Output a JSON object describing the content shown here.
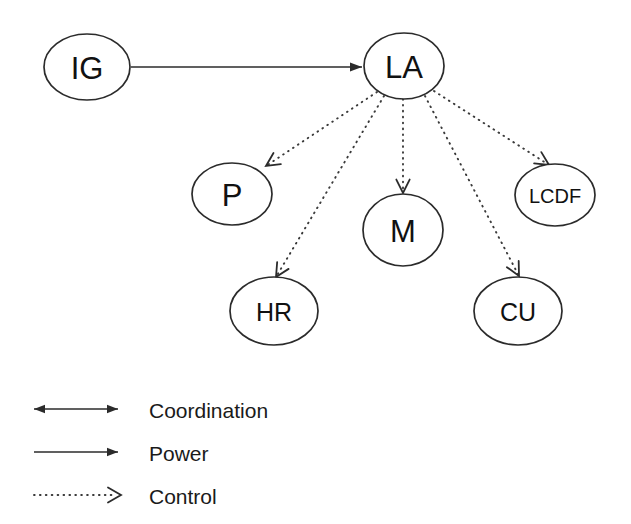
{
  "diagram": {
    "background_color": "#ffffff",
    "stroke_color": "#2b2b2b",
    "text_color": "#111111",
    "nodes": [
      {
        "id": "IG",
        "label": "IG",
        "cx": 87,
        "cy": 67,
        "rx": 43,
        "ry": 33,
        "label_size": "label-lg"
      },
      {
        "id": "LA",
        "label": "LA",
        "cx": 404,
        "cy": 66,
        "rx": 40,
        "ry": 33,
        "label_size": "label-lg"
      },
      {
        "id": "P",
        "label": "P",
        "cx": 232,
        "cy": 194,
        "rx": 40,
        "ry": 31,
        "label_size": "label-lg"
      },
      {
        "id": "M",
        "label": "M",
        "cx": 403,
        "cy": 230,
        "rx": 40,
        "ry": 36,
        "label_size": "label-lg"
      },
      {
        "id": "LCDF",
        "label": "LCDF",
        "cx": 555,
        "cy": 195,
        "rx": 40,
        "ry": 31,
        "label_size": "label-sm"
      },
      {
        "id": "HR",
        "label": "HR",
        "cx": 274,
        "cy": 311,
        "rx": 44,
        "ry": 34,
        "label_size": "label-md"
      },
      {
        "id": "CU",
        "label": "CU",
        "cx": 518,
        "cy": 311,
        "rx": 44,
        "ry": 34,
        "label_size": "label-md"
      }
    ],
    "edges": [
      {
        "id": "IG-LA",
        "from": "IG",
        "to": "LA",
        "type": "power",
        "x1": 131,
        "y1": 67,
        "x2": 362,
        "y2": 67
      },
      {
        "id": "LA-P",
        "from": "LA",
        "to": "P",
        "type": "control",
        "x1": 377,
        "y1": 92,
        "x2": 266,
        "y2": 166
      },
      {
        "id": "LA-HR",
        "from": "LA",
        "to": "HR",
        "type": "control",
        "x1": 384,
        "y1": 96,
        "x2": 276,
        "y2": 277
      },
      {
        "id": "LA-M",
        "from": "LA",
        "to": "M",
        "type": "control",
        "x1": 403,
        "y1": 99,
        "x2": 403,
        "y2": 193
      },
      {
        "id": "LA-CU",
        "from": "LA",
        "to": "CU",
        "type": "control",
        "x1": 425,
        "y1": 96,
        "x2": 519,
        "y2": 276
      },
      {
        "id": "LA-LCDF",
        "from": "LA",
        "to": "LCDF",
        "type": "control",
        "x1": 434,
        "y1": 91,
        "x2": 549,
        "y2": 165
      }
    ]
  },
  "legend": {
    "items": [
      {
        "id": "coordination",
        "label": "Coordination",
        "style": "bidirectional-solid",
        "y": 409,
        "line_x1": 34,
        "line_x2": 118,
        "text_x": 149
      },
      {
        "id": "power",
        "label": "Power",
        "style": "unidirectional-solid",
        "y": 452,
        "line_x1": 34,
        "line_x2": 118,
        "text_x": 149
      },
      {
        "id": "control",
        "label": "Control",
        "style": "unidirectional-dotted-open",
        "y": 495,
        "line_x1": 34,
        "line_x2": 112,
        "text_x": 149
      }
    ]
  }
}
